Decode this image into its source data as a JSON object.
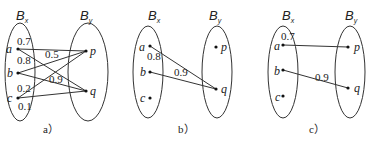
{
  "panels": [
    {
      "id": "a",
      "caption": "a）",
      "left_set": {
        "name": "B",
        "sub": "x"
      },
      "right_set": {
        "name": "B",
        "sub": "y"
      },
      "left_nodes": [
        "a",
        "b",
        "c"
      ],
      "right_nodes": [
        "p",
        "q"
      ],
      "edges": [
        {
          "from": "a",
          "to": "p",
          "weight": "0.7"
        },
        {
          "from": "a",
          "to": "q",
          "weight": "0.8"
        },
        {
          "from": "b",
          "to": "p",
          "weight": "0.5"
        },
        {
          "from": "b",
          "to": "q",
          "weight": "0.9"
        },
        {
          "from": "c",
          "to": "p",
          "weight": "0.2"
        },
        {
          "from": "c",
          "to": "q",
          "weight": "0.1"
        }
      ]
    },
    {
      "id": "b",
      "caption": "b）",
      "left_set": {
        "name": "B",
        "sub": "x"
      },
      "right_set": {
        "name": "B",
        "sub": "y"
      },
      "left_nodes": [
        "a",
        "b",
        "c"
      ],
      "right_nodes": [
        "p",
        "q"
      ],
      "edges": [
        {
          "from": "a",
          "to": "q",
          "weight": "0.8"
        },
        {
          "from": "b",
          "to": "q",
          "weight": "0.9"
        }
      ]
    },
    {
      "id": "c",
      "caption": "c）",
      "left_set": {
        "name": "B",
        "sub": "x"
      },
      "right_set": {
        "name": "B",
        "sub": "y"
      },
      "left_nodes": [
        "a",
        "b",
        "c"
      ],
      "right_nodes": [
        "p",
        "q"
      ],
      "edges": [
        {
          "from": "a",
          "to": "p",
          "weight": "0.7"
        },
        {
          "from": "b",
          "to": "q",
          "weight": "0.9"
        }
      ]
    }
  ]
}
